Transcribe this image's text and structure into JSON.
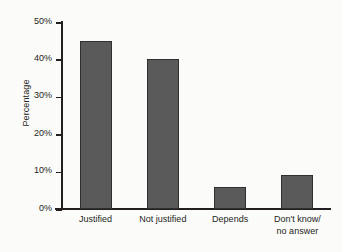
{
  "chart_data": {
    "type": "bar",
    "title": "",
    "xlabel": "",
    "ylabel": "Percentage",
    "categories": [
      "Justified",
      "Not justified",
      "Depends",
      "Don't know/ no answer"
    ],
    "category_lines": [
      [
        "Justified"
      ],
      [
        "Not justified"
      ],
      [
        "Depends"
      ],
      [
        "Don't know/",
        "no answer"
      ]
    ],
    "values": [
      45,
      40,
      6,
      9
    ],
    "value_labels": [
      "45%",
      "40%",
      "6%",
      "9%"
    ],
    "ylim": [
      0,
      50
    ],
    "ytick_values": [
      50,
      40,
      30,
      20,
      10,
      0
    ],
    "ytick_labels": [
      "50%",
      "40%",
      "30%",
      "20%",
      "10%",
      "0%"
    ],
    "grid": false,
    "legend": false,
    "legend_position": "none",
    "units": "percent",
    "colors": {
      "bar_fill": "#5a5a5a",
      "bar_border": "#2f2f2f",
      "axis": "#231f20",
      "text": "#231f20",
      "background": "#fbfbfa"
    }
  }
}
